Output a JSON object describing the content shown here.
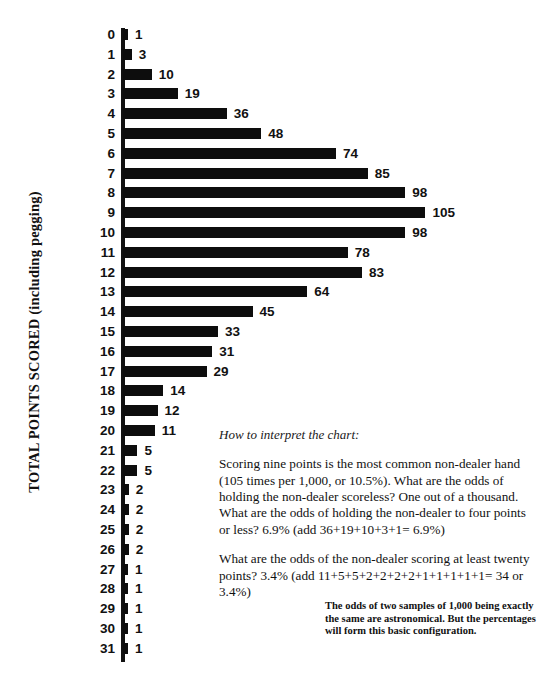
{
  "axis": {
    "title": "TOTAL POINTS SCORED (including pegging)"
  },
  "chart_data": {
    "type": "bar",
    "orientation": "horizontal",
    "title": "",
    "xlabel": "",
    "ylabel": "TOTAL POINTS SCORED (including pegging)",
    "grid": false,
    "legend": "none",
    "xlim": [
      0,
      105
    ],
    "categories": [
      "0",
      "1",
      "2",
      "3",
      "4",
      "5",
      "6",
      "7",
      "8",
      "9",
      "10",
      "11",
      "12",
      "13",
      "14",
      "15",
      "16",
      "17",
      "18",
      "19",
      "20",
      "21",
      "22",
      "23",
      "24",
      "25",
      "26",
      "27",
      "28",
      "29",
      "30",
      "31"
    ],
    "values": [
      1,
      3,
      10,
      19,
      36,
      48,
      74,
      85,
      98,
      105,
      98,
      78,
      83,
      64,
      45,
      33,
      31,
      29,
      14,
      12,
      11,
      5,
      5,
      2,
      2,
      2,
      2,
      1,
      1,
      1,
      1,
      1
    ],
    "value_labels": [
      "1",
      "3",
      "10",
      "19",
      "36",
      "48",
      "74",
      "85",
      "98",
      "105",
      "98",
      "78",
      "83",
      "64",
      "45",
      "33",
      "31",
      "29",
      "14",
      "12",
      "11",
      "5",
      "5",
      "2",
      "2",
      "2",
      "2",
      "1",
      "1",
      "1",
      "1",
      "1"
    ]
  },
  "interpret": {
    "heading": "How to interpret the chart:",
    "paragraphs": [
      "Scoring nine points is the most common non-dealer hand (105 times per 1,000, or 10.5%). What are the odds of holding the non-dealer scoreless? One out of a thousand. What are the odds of holding the non-dealer to four points or less? 6.9% (add 36+19+10+3+1= 6.9%)",
      "What are the odds of the non-dealer scoring at least twenty points? 3.4% (add 11+5+5+2+2+2+2+1+1+1+1+1= 34 or 3.4%)"
    ]
  },
  "footnote": {
    "text": "The odds of two samples of 1,000 being exactly the same are astronomical.  But the percentages will form this basic configuration."
  },
  "colors": {
    "bar": "#0d0d0d",
    "text": "#111111",
    "background": "#ffffff"
  }
}
